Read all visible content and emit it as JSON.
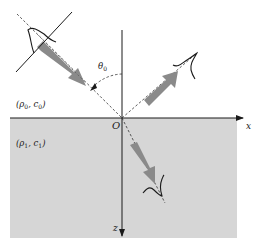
{
  "diagram": {
    "colors": {
      "background": "#ffffff",
      "lower_medium_fill": "#d6d6d6",
      "arrow_fill": "#8a8a8a",
      "line": "#1a1a1a"
    },
    "labels": {
      "upper_medium": {
        "rho": "ρ",
        "rho_sub": "0",
        "sep": ", ",
        "c": "c",
        "c_sub": "0"
      },
      "lower_medium": {
        "rho": "ρ",
        "rho_sub": "1",
        "sep": ", ",
        "c": "c",
        "c_sub": "1"
      },
      "angle": {
        "symbol": "θ",
        "sub": "0"
      },
      "origin": "O",
      "x_axis": "x",
      "z_axis": "z"
    },
    "elements": [
      {
        "id": "incident-wave",
        "description": "incident pulse with planar wavefront, gray arrow pointing toward origin"
      },
      {
        "id": "reflected-wave",
        "description": "reflected pulse traveling up-right from origin"
      },
      {
        "id": "transmitted-wave",
        "description": "transmitted pulse traveling down into lower medium"
      },
      {
        "id": "incidence-angle",
        "description": "dashed arc marking angle θ0 between incident ray and z-axis"
      }
    ]
  }
}
